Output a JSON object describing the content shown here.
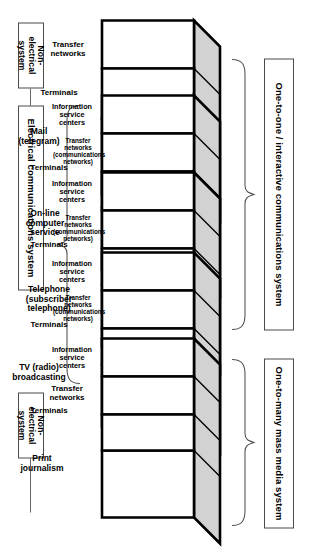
{
  "diagram": {
    "orientation_note": "rotated-90",
    "colors": {
      "top_face": "#d2d2d2",
      "front_face": "#ffffff",
      "outline": "#000000",
      "label_border": "#4a4a4a",
      "brace": "#555555"
    }
  },
  "side_labels": {
    "non_electrical_top": "Non-\nelectrical\nsystem",
    "electrical": "Electrical communications system",
    "non_electrical_bottom": "Non-\nelectrical\nsystem"
  },
  "group_labels": {
    "one_to_one": "One-to-one /\ninteractive communications system",
    "one_to_many": "One-to-many\nmass media system"
  },
  "panel_names": {
    "information_service_centers": "Information\nservice\ncenters",
    "transfer_networks_plain": "Transfer\nnetworks",
    "transfer_networks_comm": "Transfer\nnetworks\n(communications\nnetworks)",
    "terminals": "Terminals"
  },
  "blocks": [
    {
      "id": "mail",
      "front": "Mail\n(telegram)",
      "panels": [
        "Transfer\nnetworks",
        "Terminals"
      ],
      "has_info_centers": false,
      "group": "one-to-one",
      "system": "non-electrical"
    },
    {
      "id": "online-computer-service",
      "front": "On-line\ncomputer\nservice",
      "panels": [
        "Information\nservice\ncenters",
        "Transfer\nnetworks\n(communications\nnetworks)",
        "Terminals"
      ],
      "has_info_centers": true,
      "group": "one-to-one",
      "system": "electrical"
    },
    {
      "id": "telephone",
      "front": "Telephone\n(subscriber\ntelephone)",
      "panels": [
        "Information\nservice\ncenters",
        "Transfer\nnetworks\n(communications\nnetworks)",
        "Terminals"
      ],
      "has_info_centers": true,
      "group": "one-to-one",
      "system": "electrical"
    },
    {
      "id": "tv-radio-broadcasting",
      "front": "TV (radio)\nbroadcasting",
      "panels": [
        "Information\nservice\ncenters",
        "Transfer\nnetworks\n(communications\nnetworks)",
        "Terminals"
      ],
      "has_info_centers": true,
      "group": "one-to-many",
      "system": "electrical"
    },
    {
      "id": "print-journalism",
      "front": "Print\njournalism",
      "panels": [
        "Information\nservice\ncenters",
        "Transfer\nnetworks",
        "Terminals"
      ],
      "has_info_centers": true,
      "group": "one-to-many",
      "system": "non-electrical"
    }
  ]
}
